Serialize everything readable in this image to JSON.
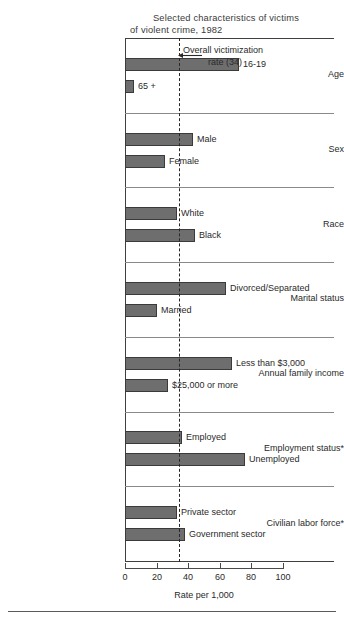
{
  "chart_data": {
    "type": "bar",
    "orientation": "horizontal",
    "title_line1": "Selected characteristics of victims",
    "title_line2": "of violent crime, 1982",
    "xlabel": "Rate per 1,000",
    "ylabel": "",
    "xlim": [
      0,
      100
    ],
    "xticks": [
      0,
      20,
      40,
      60,
      80,
      100
    ],
    "xtick_labels": [
      "0",
      "20",
      "40",
      "60",
      "80",
      "100"
    ],
    "grid": false,
    "legend": "none",
    "reference_line": {
      "value": 34,
      "label_line1": "Overall victimization",
      "label_line2": "rate (34)",
      "style": "dashed"
    },
    "groups": [
      {
        "name": "Age",
        "bars": [
          {
            "label": "16-19",
            "value": 72
          },
          {
            "label": "65 +",
            "value": 6
          }
        ]
      },
      {
        "name": "Sex",
        "bars": [
          {
            "label": "Male",
            "value": 43
          },
          {
            "label": "Female",
            "value": 25
          }
        ]
      },
      {
        "name": "Race",
        "bars": [
          {
            "label": "White",
            "value": 33
          },
          {
            "label": "Black",
            "value": 44
          }
        ]
      },
      {
        "name": "Marital status",
        "bars": [
          {
            "label": "Divorced/Separated",
            "value": 64
          },
          {
            "label": "Married",
            "value": 20
          }
        ]
      },
      {
        "name": "Annual family income",
        "bars": [
          {
            "label": "Less than $3,000",
            "value": 68
          },
          {
            "label": "$25,000 or more",
            "value": 27
          }
        ]
      },
      {
        "name": "Employment status*",
        "bars": [
          {
            "label": "Employed",
            "value": 36
          },
          {
            "label": "Unemployed",
            "value": 76
          }
        ]
      },
      {
        "name": "Civilian labor force*",
        "bars": [
          {
            "label": "Private sector",
            "value": 33
          },
          {
            "label": "Government sector",
            "value": 38
          }
        ]
      }
    ],
    "colors": {
      "bar_fill": "#6e6e6e",
      "bar_stroke": "#3a3a3a",
      "axis": "#3f3f3f",
      "text": "#2a2a2a",
      "background": "#ffffff"
    }
  }
}
